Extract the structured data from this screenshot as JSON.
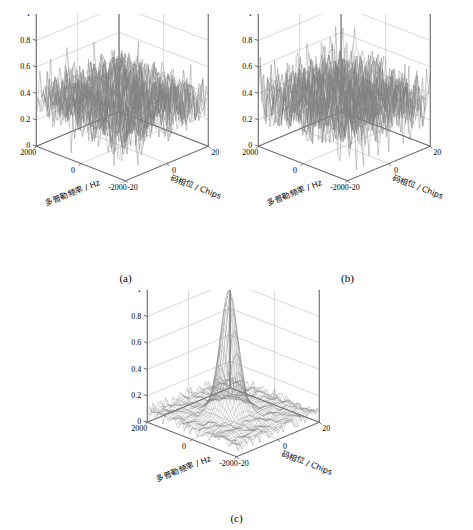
{
  "figure": {
    "background": "#ffffff",
    "panels": [
      {
        "id": "a",
        "caption": "(a)",
        "type": "surface3d",
        "zlabel": "归一化相关峰",
        "xlabel": "码相位 / Chips",
        "ylabel": "多普勒频率 / Hz",
        "z_ticks": [
          "0",
          "0.2",
          "0.4",
          "0.6",
          "0.8",
          "1"
        ],
        "x_ticks": [
          "-20",
          "0",
          "20"
        ],
        "y_ticks": [
          "-2000",
          "0",
          "2000"
        ],
        "zlim": [
          0,
          1
        ],
        "xlim": [
          -20,
          20
        ],
        "ylim": [
          -2000,
          2000
        ],
        "grid": true,
        "description": "noise-only correlation surface, no distinct peak",
        "peak": null,
        "noise_floor": [
          0.0,
          0.65
        ],
        "line_color": "#808080"
      },
      {
        "id": "b",
        "caption": "(b)",
        "type": "surface3d",
        "zlabel": "归一化相关峰",
        "xlabel": "码相位 / Chips",
        "ylabel": "多普勒频率 / Hz",
        "z_ticks": [
          "0",
          "0.2",
          "0.4",
          "0.6",
          "0.8",
          "1"
        ],
        "x_ticks": [
          "-20",
          "0",
          "20"
        ],
        "y_ticks": [
          "-2000",
          "0",
          "2000"
        ],
        "zlim": [
          0,
          1
        ],
        "xlim": [
          -20,
          20
        ],
        "ylim": [
          -2000,
          2000
        ],
        "grid": true,
        "description": "noise-only correlation surface, no distinct peak",
        "peak": null,
        "noise_floor": [
          0.0,
          0.7
        ],
        "line_color": "#808080"
      },
      {
        "id": "c",
        "caption": "(c)",
        "type": "surface3d",
        "zlabel": "归一化相关峰",
        "xlabel": "码相位 / Chips",
        "ylabel": "多普勒频率 / Hz",
        "z_ticks": [
          "0",
          "0.2",
          "0.4",
          "0.6",
          "0.8",
          "1"
        ],
        "x_ticks": [
          "-20",
          "0",
          "20"
        ],
        "y_ticks": [
          "-2000",
          "0",
          "2000"
        ],
        "zlim": [
          0,
          1
        ],
        "xlim": [
          -20,
          20
        ],
        "ylim": [
          -2000,
          2000
        ],
        "grid": true,
        "description": "single sharp acquisition peak near center, flat noise floor",
        "peak": {
          "x": 0,
          "y": 0,
          "z": 1.0
        },
        "noise_floor": [
          0.0,
          0.12
        ],
        "line_color": "#808080"
      }
    ]
  },
  "chart_data": {
    "type": "surface",
    "title": "",
    "panels": [
      {
        "label": "(a)",
        "xlabel": "码相位 / Chips",
        "ylabel": "多普勒频率 / Hz",
        "zlabel": "归一化相关峰",
        "xlim": [
          -20,
          20
        ],
        "ylim": [
          -2000,
          2000
        ],
        "zlim": [
          0,
          1
        ],
        "xticks": [
          -20,
          0,
          20
        ],
        "yticks": [
          -2000,
          0,
          2000
        ],
        "zticks": [
          0,
          0.2,
          0.4,
          0.6,
          0.8,
          1
        ],
        "peak_value": 0.65,
        "peak_location": null,
        "mean_noise": 0.2,
        "grid": true
      },
      {
        "label": "(b)",
        "xlabel": "码相位 / Chips",
        "ylabel": "多普勒频率 / Hz",
        "zlabel": "归一化相关峰",
        "xlim": [
          -20,
          20
        ],
        "ylim": [
          -2000,
          2000
        ],
        "zlim": [
          0,
          1
        ],
        "xticks": [
          -20,
          0,
          20
        ],
        "yticks": [
          -2000,
          0,
          2000
        ],
        "zticks": [
          0,
          0.2,
          0.4,
          0.6,
          0.8,
          1
        ],
        "peak_value": 0.7,
        "peak_location": null,
        "mean_noise": 0.2,
        "grid": true
      },
      {
        "label": "(c)",
        "xlabel": "码相位 / Chips",
        "ylabel": "多普勒频率 / Hz",
        "zlabel": "归一化相关峰",
        "xlim": [
          -20,
          20
        ],
        "ylim": [
          -2000,
          2000
        ],
        "zlim": [
          0,
          1
        ],
        "xticks": [
          -20,
          0,
          20
        ],
        "yticks": [
          -2000,
          0,
          2000
        ],
        "zticks": [
          0,
          0.2,
          0.4,
          0.6,
          0.8,
          1
        ],
        "peak_value": 1.0,
        "peak_location": {
          "code_phase": 0,
          "doppler": 0
        },
        "mean_noise": 0.04,
        "grid": true
      }
    ],
    "legend": null,
    "legend_position": "none"
  }
}
